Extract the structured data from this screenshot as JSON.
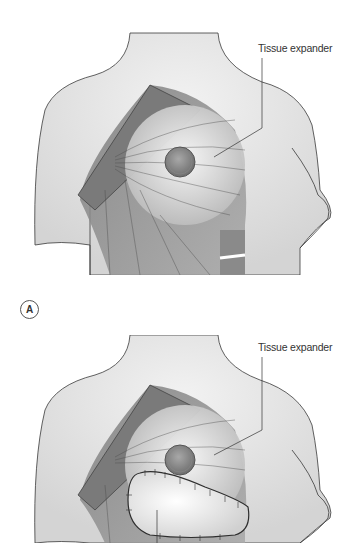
{
  "figure": {
    "panels": [
      {
        "id": "A",
        "badge": "A",
        "label": "Tissue expander"
      },
      {
        "id": "B",
        "label": "Tissue expander"
      }
    ]
  },
  "colors": {
    "skin": "#e6e6e6",
    "muscle": "#8c8c8c",
    "outline": "#3a3a3a",
    "flap": "#f8f8f8"
  }
}
